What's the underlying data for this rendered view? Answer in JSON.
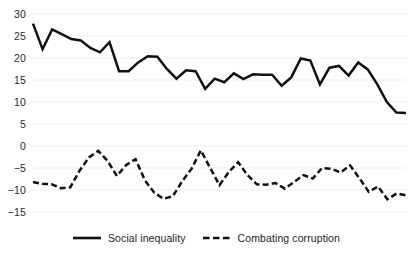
{
  "chart_data": {
    "type": "line",
    "title": "",
    "subtitle": "",
    "xlabel": "",
    "ylabel": "",
    "ylim": [
      -15,
      30
    ],
    "xlim": [
      0,
      43
    ],
    "yticks": [
      -15,
      -10,
      -5,
      0,
      5,
      10,
      15,
      20,
      25,
      30
    ],
    "ytick_labels": [
      "−15",
      "−10",
      "−5",
      "0",
      "5",
      "10",
      "15",
      "20",
      "25",
      "30"
    ],
    "xticks": [],
    "xtick_labels": [],
    "grid": "horizontal",
    "legend_position": "bottom-center",
    "series": [
      {
        "name": "Social inequality",
        "style": "solid",
        "color": "#111111",
        "values": [
          27.8,
          22.0,
          26.5,
          25.4,
          24.3,
          24.0,
          22.3,
          21.3,
          23.6,
          17.0,
          17.0,
          19.0,
          20.4,
          20.3,
          17.5,
          15.3,
          17.2,
          17.0,
          13.0,
          15.3,
          14.5,
          16.5,
          15.2,
          16.3,
          16.2,
          16.2,
          13.7,
          15.6,
          19.9,
          19.4,
          14.0,
          17.8,
          18.2,
          16.0,
          19.0,
          17.4,
          14.0,
          10.0,
          7.6,
          7.5
        ]
      },
      {
        "name": "Combating corruption",
        "style": "dashed",
        "color": "#111111",
        "values": [
          -8.2,
          -8.6,
          -8.7,
          -9.6,
          -9.4,
          -5.6,
          -2.6,
          -1.1,
          -3.4,
          -6.8,
          -4.3,
          -3.0,
          -7.8,
          -10.6,
          -12.0,
          -11.4,
          -8.0,
          -5.2,
          -1.0,
          -5.0,
          -8.9,
          -5.9,
          -3.7,
          -6.6,
          -8.7,
          -8.8,
          -8.4,
          -9.7,
          -8.2,
          -6.6,
          -7.4,
          -5.0,
          -5.2,
          -6.0,
          -4.4,
          -7.3,
          -10.4,
          -9.2,
          -12.1,
          -10.8,
          -11.2
        ]
      }
    ],
    "legend": [
      {
        "label": "Social inequality",
        "style": "solid"
      },
      {
        "label": "Combating corruption",
        "style": "dashed"
      }
    ]
  },
  "colors": {
    "line": "#111111",
    "grid": "#f0f0f0",
    "tick_text": "#2b2b2b",
    "background": "#ffffff"
  }
}
